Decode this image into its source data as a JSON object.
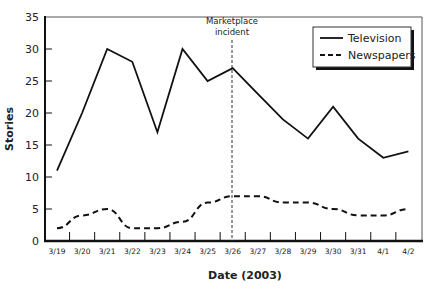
{
  "chart_data": {
    "type": "line",
    "title": "",
    "xlabel": "Date (2003)",
    "ylabel": "Stories",
    "ylim": [
      0,
      35
    ],
    "yticks": [
      0,
      5,
      10,
      15,
      20,
      25,
      30,
      35
    ],
    "grid": false,
    "legend_position": "upper right",
    "categories": [
      "3/19",
      "3/20",
      "3/21",
      "3/22",
      "3/23",
      "3/24",
      "3/25",
      "3/26",
      "3/27",
      "3/28",
      "3/29",
      "3/30",
      "3/31",
      "4/1",
      "4/2"
    ],
    "series": [
      {
        "name": "Television",
        "style": "solid",
        "values": [
          11,
          20,
          30,
          28,
          17,
          30,
          25,
          27,
          23,
          19,
          16,
          21,
          16,
          13,
          14
        ]
      },
      {
        "name": "Newspapers",
        "style": "dashed",
        "values": [
          2,
          4,
          5,
          2,
          2,
          3,
          6,
          7,
          7,
          6,
          6,
          5,
          4,
          4,
          5
        ]
      }
    ],
    "annotations": [
      {
        "text_line1": "Marketplace",
        "text_line2": "incident",
        "x": "3/26",
        "style": "dotted vertical line"
      }
    ]
  },
  "labels": {
    "xlabel": "Date (2003)",
    "ylabel": "Stories",
    "annotation_line1": "Marketplace",
    "annotation_line2": "incident",
    "legend_tv": "Television",
    "legend_np": "Newspapers"
  }
}
